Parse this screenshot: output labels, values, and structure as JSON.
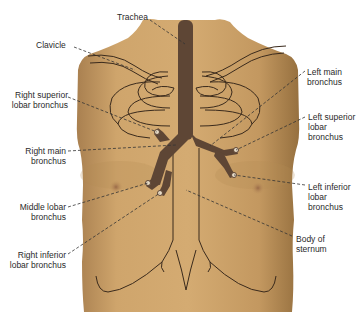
{
  "figure": {
    "colors": {
      "background": "#ffffff",
      "skin_light": "#d4ab72",
      "skin_mid": "#c49a60",
      "skin_dark": "#9c7644",
      "airway": "#5e4635",
      "outline": "#3a2a1c",
      "leader": "#333333",
      "text": "#2a2a2a"
    },
    "labels": [
      {
        "id": "trachea",
        "text": "Trachea",
        "x": 117,
        "y": 12,
        "align": "left"
      },
      {
        "id": "clavicle",
        "text": "Clavicle",
        "x": 36,
        "y": 38,
        "align": "left"
      },
      {
        "id": "right-superior-lobar-bronchus",
        "text": "Right superior\nlobar bronchus",
        "x": 8,
        "y": 92,
        "align": "right"
      },
      {
        "id": "right-main-bronchus",
        "text": "Right main\nbronchus",
        "x": 23,
        "y": 149,
        "align": "right"
      },
      {
        "id": "middle-lobar-bronchus",
        "text": "Middle lobar\nbronchus",
        "x": 17,
        "y": 204,
        "align": "right"
      },
      {
        "id": "right-inferior-lobar-bronchus",
        "text": "Right inferior\nlobar bronchus",
        "x": 9,
        "y": 252,
        "align": "right"
      },
      {
        "id": "left-main-bronchus",
        "text": "Left main\nbronchus",
        "x": 307,
        "y": 69,
        "align": "left"
      },
      {
        "id": "left-superior-lobar-bronchus",
        "text": "Left superior\nlobar\nbronchus",
        "x": 308,
        "y": 115,
        "align": "left"
      },
      {
        "id": "left-inferior-lobar-bronchus",
        "text": "Left inferior\nlobar\nbronchus",
        "x": 308,
        "y": 184,
        "align": "left"
      },
      {
        "id": "body-of-sternum",
        "text": "Body of\nsternum",
        "x": 296,
        "y": 235,
        "align": "left"
      }
    ]
  }
}
